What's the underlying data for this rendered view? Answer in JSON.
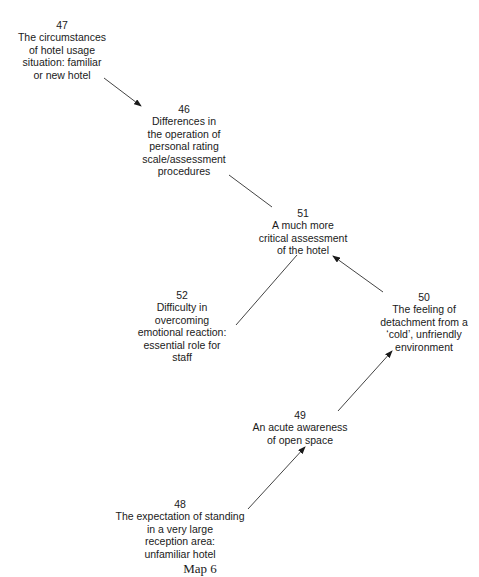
{
  "diagram": {
    "caption": "Map 6",
    "nodes": [
      {
        "id": "47",
        "number": "47",
        "lines": [
          "The circumstances",
          "of hotel usage",
          "situation: familiar",
          "or new hotel"
        ],
        "cx": 62,
        "top": 19
      },
      {
        "id": "46",
        "number": "46",
        "lines": [
          "Differences in",
          "the operation of",
          "personal rating",
          "scale/assessment",
          "procedures"
        ],
        "cx": 184,
        "top": 103
      },
      {
        "id": "51",
        "number": "51",
        "lines": [
          "A much more",
          "critical assessment",
          "of the hotel"
        ],
        "cx": 303,
        "top": 207
      },
      {
        "id": "52",
        "number": "52",
        "lines": [
          "Difficulty in",
          "overcoming",
          "emotional reaction:",
          "essential role for",
          "staff"
        ],
        "cx": 182,
        "top": 289
      },
      {
        "id": "50",
        "number": "50",
        "lines": [
          "The feeling of",
          "detachment from a",
          "‘cold’, unfriendly",
          "environment"
        ],
        "cx": 424,
        "top": 291
      },
      {
        "id": "49",
        "number": "49",
        "lines": [
          "An acute awareness",
          "of open space"
        ],
        "cx": 300,
        "top": 409
      },
      {
        "id": "48",
        "number": "48",
        "lines": [
          "The expectation of standing",
          "in a very large",
          "reception area:",
          "unfamiliar hotel"
        ],
        "cx": 180,
        "top": 498
      }
    ],
    "edges": [
      {
        "from": "47",
        "to": "46",
        "arrow": true,
        "x1": 104,
        "y1": 78,
        "x2": 141,
        "y2": 106
      },
      {
        "from": "46",
        "to": "51",
        "arrow": false,
        "x1": 229,
        "y1": 175,
        "x2": 272,
        "y2": 207
      },
      {
        "from": "52",
        "to": "51",
        "arrow": false,
        "x1": 236,
        "y1": 325,
        "x2": 297,
        "y2": 255
      },
      {
        "from": "50",
        "to": "51",
        "arrow": true,
        "x1": 383,
        "y1": 292,
        "x2": 333,
        "y2": 256
      },
      {
        "from": "49",
        "to": "50",
        "arrow": true,
        "x1": 338,
        "y1": 411,
        "x2": 392,
        "y2": 351
      },
      {
        "from": "48",
        "to": "49",
        "arrow": true,
        "x1": 248,
        "y1": 509,
        "x2": 305,
        "y2": 447
      }
    ],
    "colors": {
      "text": "#1a1a1a",
      "line": "#444444",
      "background": "#ffffff"
    }
  }
}
